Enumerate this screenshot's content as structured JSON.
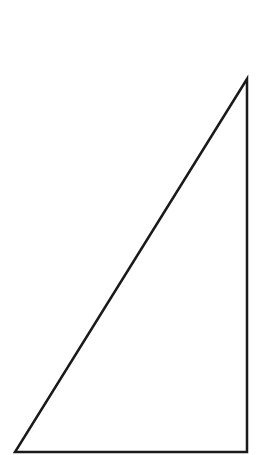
{
  "canvas": {
    "width": 280,
    "height": 455,
    "background": "#ffffff"
  },
  "shape": {
    "type": "right-triangle",
    "stroke": "#1a1a1a",
    "stroke_width": 2.5,
    "fill": "none",
    "vertices": {
      "top": [
        247,
        79
      ],
      "bottom_right": [
        247,
        452
      ],
      "bottom_left": [
        15,
        452
      ]
    }
  }
}
